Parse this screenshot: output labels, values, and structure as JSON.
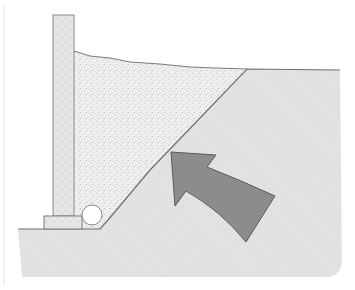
{
  "diagram": {
    "type": "cross-section illustration",
    "elements": {
      "wall": {
        "label": "Retaining wall",
        "color": "#e4e4e4",
        "stroke": "#8a8a8a"
      },
      "footing": {
        "label": "Wall footing",
        "color": "#e0e0e0",
        "stroke": "#7a7a7a"
      },
      "backfill": {
        "label": "Gravel backfill",
        "color": "#ececec"
      },
      "native_soil": {
        "label": "Native soil",
        "color": "#f2f2f2",
        "hatch": "#c8c8c8"
      },
      "drain_pipe": {
        "label": "Drain pipe",
        "color": "#ffffff",
        "stroke": "#8a8a8a"
      },
      "pressure_arrow": {
        "label": "Soil pressure direction",
        "color": "#8c8c8c",
        "stroke": "#5a5a5a"
      }
    }
  }
}
